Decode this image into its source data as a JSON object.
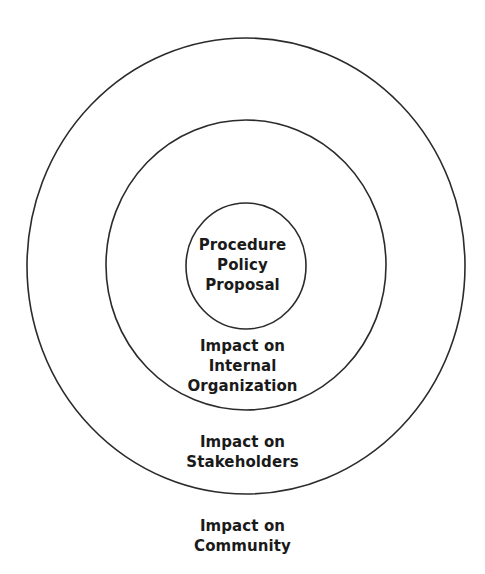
{
  "diagram": {
    "type": "concentric-circles",
    "colors": {
      "stroke": "#2b2b2b",
      "text": "#1a1a1a",
      "background": "#ffffff"
    },
    "rings": [
      {
        "id": "core",
        "lines": [
          "Procedure",
          "Policy",
          "Proposal"
        ]
      },
      {
        "id": "internal",
        "lines": [
          "Impact on",
          "Internal",
          "Organization"
        ]
      },
      {
        "id": "stakeholders",
        "lines": [
          "Impact on",
          "Stakeholders"
        ]
      },
      {
        "id": "community",
        "lines": [
          "Impact on",
          "Community"
        ]
      }
    ]
  }
}
